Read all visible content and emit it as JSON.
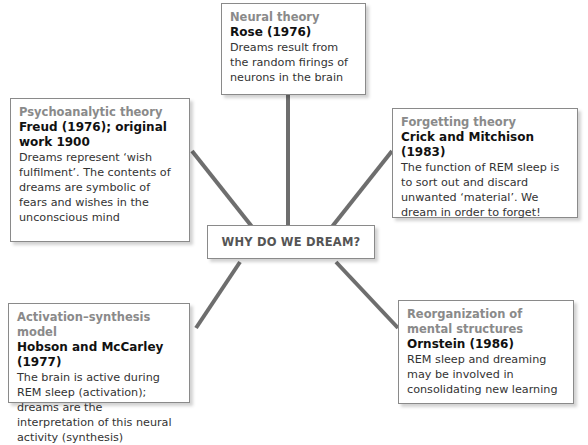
{
  "center": {
    "label": "WHY DO WE DREAM?"
  },
  "theories": [
    {
      "category": "Neural theory",
      "author": "Rose (1976)",
      "description": "Dreams result from the random firings of neurons in the brain"
    },
    {
      "category": "Psychoanalytic theory",
      "author": "Freud (1976); original work 1900",
      "description": "Dreams represent ‘wish fulfilment’. The contents of dreams are symbolic of fears and wishes in the unconscious mind"
    },
    {
      "category": "Forgetting theory",
      "author": "Crick and Mitchison (1983)",
      "description": "The function of REM sleep is to sort out and discard unwanted ‘material’. We dream in order to forget!"
    },
    {
      "category": "Activation–synthesis model",
      "author": "Hobson and McCarley (1977)",
      "description": "The brain is active during REM sleep (activation); dreams are the interpretation of this neural activity (synthesis)"
    },
    {
      "category": "Reorganization of mental structures",
      "author": "Ornstein (1986)",
      "description": "REM sleep and dreaming may be involved in consolidating new learning"
    }
  ],
  "colors": {
    "connector": "#6e6e6e",
    "category_text": "#8a8a8a",
    "border": "#8a8a8a"
  }
}
